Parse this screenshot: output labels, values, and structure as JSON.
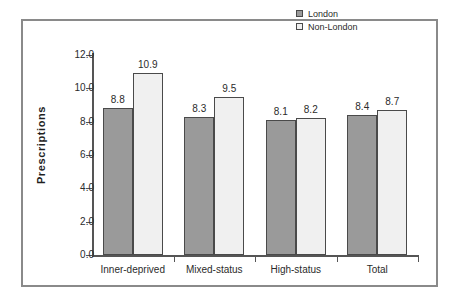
{
  "chart_data": {
    "type": "bar",
    "title": "",
    "subtitle": "",
    "xlabel": "",
    "ylabel": "Prescriptions",
    "ylim": [
      0.0,
      12.0
    ],
    "ytick_labels": [
      "0.0",
      "2.0",
      "4.0",
      "6.0",
      "8.0",
      "10.0",
      "12.0"
    ],
    "ytick_values": [
      0.0,
      2.0,
      4.0,
      6.0,
      8.0,
      10.0,
      12.0
    ],
    "grid": false,
    "legend_position": "top-right",
    "categories": [
      "Inner-deprived",
      "Mixed-status",
      "High-status",
      "Total"
    ],
    "series": [
      {
        "name": "London",
        "color": "#9a9a9a",
        "values": [
          8.8,
          8.3,
          8.1,
          8.4
        ],
        "labels": [
          "8.8",
          "8.3",
          "8.1",
          "8.4"
        ]
      },
      {
        "name": "Non-London",
        "color": "#f0f0f0",
        "values": [
          10.9,
          9.5,
          8.2,
          8.7
        ],
        "labels": [
          "10.9",
          "9.5",
          "8.2",
          "8.7"
        ]
      }
    ]
  },
  "legend": {
    "entries": [
      {
        "label": "London"
      },
      {
        "label": "Non-London"
      }
    ]
  },
  "axis": {
    "y_title": "Prescriptions"
  }
}
